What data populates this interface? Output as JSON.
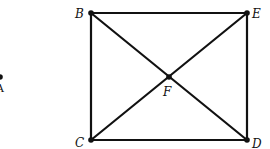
{
  "diagram": {
    "type": "geometry-graph",
    "points": {
      "A": {
        "label": "A",
        "x": 0,
        "y": 77
      },
      "B": {
        "label": "B",
        "x": 91,
        "y": 13
      },
      "E": {
        "label": "E",
        "x": 247,
        "y": 13
      },
      "C": {
        "label": "C",
        "x": 91,
        "y": 140
      },
      "D": {
        "label": "D",
        "x": 247,
        "y": 140
      },
      "F": {
        "label": "F",
        "x": 169,
        "y": 77
      }
    },
    "edges": [
      [
        "B",
        "E"
      ],
      [
        "B",
        "C"
      ],
      [
        "E",
        "D"
      ],
      [
        "C",
        "D"
      ],
      [
        "B",
        "D"
      ],
      [
        "E",
        "C"
      ]
    ],
    "labels": {
      "B": "B",
      "E": "E",
      "C": "C",
      "D": "D",
      "F": "F",
      "A": "A"
    },
    "colors": {
      "stroke": "#111111",
      "background": "#ffffff"
    }
  }
}
